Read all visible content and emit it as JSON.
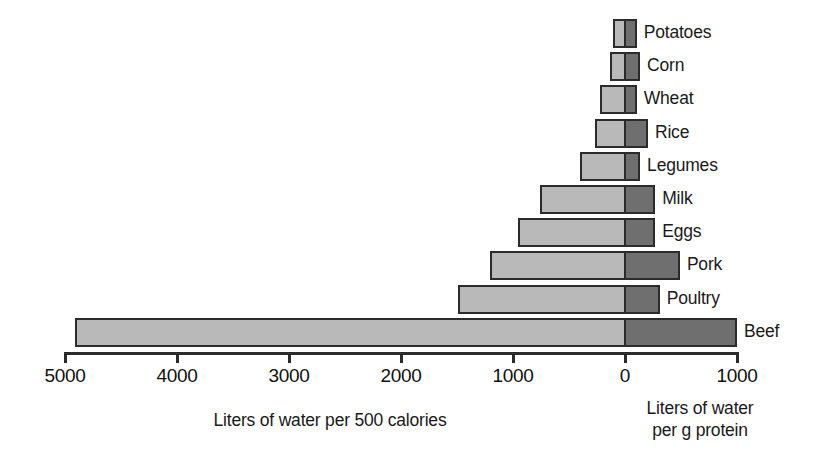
{
  "chart_data": {
    "type": "bar",
    "title": "",
    "orientation": "horizontal",
    "diverging": true,
    "categories": [
      "Potatoes",
      "Corn",
      "Wheat",
      "Rice",
      "Legumes",
      "Milk",
      "Eggs",
      "Pork",
      "Poultry",
      "Beef"
    ],
    "series": [
      {
        "name": "Liters of water per 500 calories",
        "direction": "left",
        "color": "#b9b9b9",
        "values": [
          105,
          135,
          225,
          270,
          400,
          760,
          955,
          1205,
          1490,
          4910
        ]
      },
      {
        "name": "Liters of water per g protein",
        "direction": "right",
        "color": "#6f6f6f",
        "values": [
          105,
          135,
          105,
          205,
          135,
          270,
          270,
          490,
          310,
          1000
        ]
      }
    ],
    "xlabel_left": "Liters of water per 500 calories",
    "xlabel_right_line1": "Liters of water",
    "xlabel_right_line2": "per g protein",
    "xticks_left": [
      5000,
      4000,
      3000,
      2000,
      1000,
      0
    ],
    "xticks_right": [
      1000
    ],
    "xtick_labels": [
      "5000",
      "4000",
      "3000",
      "2000",
      "1000",
      "0",
      "1000"
    ],
    "xlim_left": 5000,
    "xlim_right": 1000,
    "grid": false,
    "legend": "none",
    "ylabel": "",
    "bar_colors": {
      "left_fill": "#b9b9b9",
      "right_fill": "#6f6f6f",
      "outline": "#2b2b2b"
    }
  },
  "axis": {
    "ticks": [
      {
        "label": "5000",
        "x": 65
      },
      {
        "label": "4000",
        "x": 177
      },
      {
        "label": "3000",
        "x": 289
      },
      {
        "label": "2000",
        "x": 401
      },
      {
        "label": "1000",
        "x": 513
      },
      {
        "label": "0",
        "x": 625
      },
      {
        "label": "1000",
        "x": 737
      }
    ]
  },
  "captions": {
    "left": "Liters of water per 500 calories",
    "right_line1": "Liters of water",
    "right_line2": "per g protein"
  }
}
